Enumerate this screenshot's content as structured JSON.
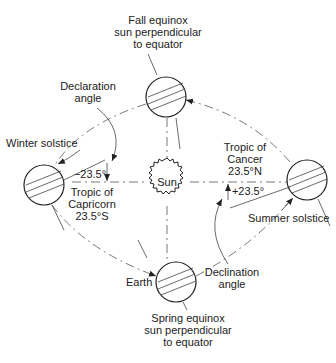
{
  "diagram": {
    "sun": {
      "label": "Sun"
    },
    "earth_label": "Earth",
    "positions": {
      "fall": {
        "line1": "Fall equinox",
        "line2": "sun perpendicular",
        "line3": "to equator"
      },
      "spring": {
        "line1": "Spring equinox",
        "line2": "sun perpendicular",
        "line3": "to equator"
      },
      "winter": {
        "label": "Winter solstice"
      },
      "summer": {
        "label": "Summer solstice"
      }
    },
    "declaration_angle": {
      "line1": "Declaration",
      "line2": "angle"
    },
    "declination_angle": {
      "line1": "Declination",
      "line2": "angle"
    },
    "tropic_capricorn": {
      "angle": "−23.5°",
      "line1": "Tropic of",
      "line2": "Capricorn",
      "line3": "23.5°S"
    },
    "tropic_cancer": {
      "angle": "+23.5°",
      "line1": "Tropic of",
      "line2": "Cancer",
      "line3": "23.5°N"
    }
  }
}
